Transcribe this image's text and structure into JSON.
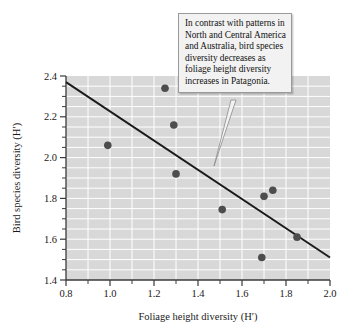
{
  "figure": {
    "background_color": "#ffffff",
    "plot_background_color": "#d8d8d8",
    "gridline_color": "#ffffff",
    "point_color": "#4d4d4d",
    "line_color": "#1a1a1a",
    "axis_color": "#3a3a3a"
  },
  "callout": {
    "name": "annotation-callout",
    "text": "In contrast with patterns in North and Central America and Australia, bird species diversity decreases as foliage height diversity increases in Patagonia.",
    "background_color": "#f2f2f2",
    "border_color": "#9a9a9a"
  },
  "axes": {
    "x": {
      "label": "Foliage height diversity (H′)",
      "ticks": [
        "0.8",
        "1.0",
        "1.2",
        "1.4",
        "1.6",
        "1.8",
        "2.0"
      ],
      "min": 0.8,
      "max": 2.0,
      "minor_step": 0.1
    },
    "y": {
      "label": "Bird species diversity (H′)",
      "ticks": [
        "1.4",
        "1.6",
        "1.8",
        "2.0",
        "2.2",
        "2.4"
      ],
      "min": 1.4,
      "max": 2.4,
      "minor_step": 0.05
    }
  },
  "chart_data": {
    "type": "scatter",
    "title": "",
    "xlabel": "Foliage height diversity (H′)",
    "ylabel": "Bird species diversity (H′)",
    "xlim": [
      0.8,
      2.0
    ],
    "ylim": [
      1.4,
      2.4
    ],
    "grid": true,
    "legend": "none",
    "series": [
      {
        "name": "Patagonia bird survey sites",
        "marker": "filled-circle",
        "color": "#4d4d4d",
        "points": [
          {
            "x": 0.99,
            "y": 2.06
          },
          {
            "x": 1.25,
            "y": 2.34
          },
          {
            "x": 1.29,
            "y": 2.16
          },
          {
            "x": 1.3,
            "y": 1.92
          },
          {
            "x": 1.51,
            "y": 1.745
          },
          {
            "x": 1.69,
            "y": 1.51
          },
          {
            "x": 1.7,
            "y": 1.81
          },
          {
            "x": 1.74,
            "y": 1.84
          },
          {
            "x": 1.85,
            "y": 1.61
          }
        ]
      }
    ],
    "trendline": {
      "name": "regression-line",
      "type": "linear",
      "color": "#1a1a1a",
      "x_start": 0.8,
      "y_start": 2.37,
      "x_end": 2.0,
      "y_end": 1.51
    },
    "annotations": [
      {
        "name": "annotation-callout",
        "text": "In contrast with patterns in North and Central America and Australia, bird species diversity decreases as foliage height diversity increases in Patagonia.",
        "points_to": {
          "x": 1.47,
          "y": 1.93
        }
      }
    ]
  }
}
